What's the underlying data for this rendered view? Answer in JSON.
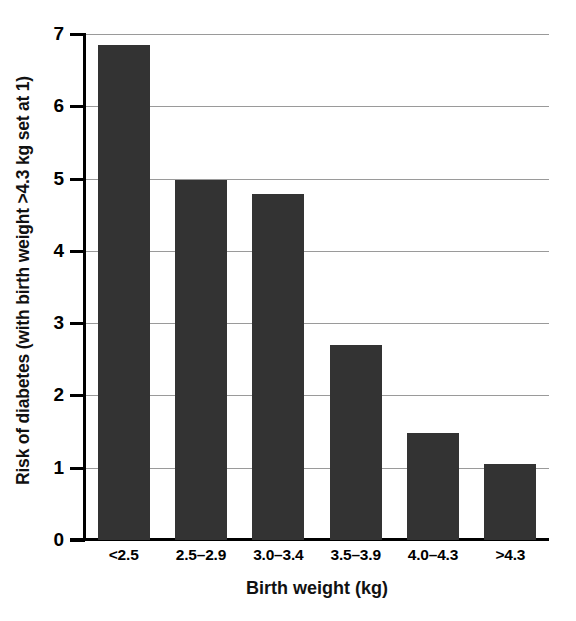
{
  "chart_data": {
    "type": "bar",
    "title": "",
    "subtitle": "",
    "xlabel": "Birth weight (kg)",
    "ylabel": "Risk of diabetes (with birth weight >4.3 kg set at 1)",
    "categories": [
      "<2.5",
      "2.5–2.9",
      "3.0–3.4",
      "3.5–3.9",
      "4.0–4.3",
      ">4.3"
    ],
    "values": [
      6.85,
      4.98,
      4.79,
      2.7,
      1.48,
      1.05
    ],
    "ylim": [
      0,
      7
    ],
    "yticks": [
      0,
      1,
      2,
      3,
      4,
      5,
      6,
      7
    ],
    "ytick_labels": [
      "0",
      "1",
      "2",
      "3",
      "4",
      "5",
      "6",
      "7"
    ],
    "grid": "horizontal",
    "legend": "none",
    "bar_color": "#333333",
    "grid_color": "#9a9a9a",
    "axis_color": "#000000"
  }
}
